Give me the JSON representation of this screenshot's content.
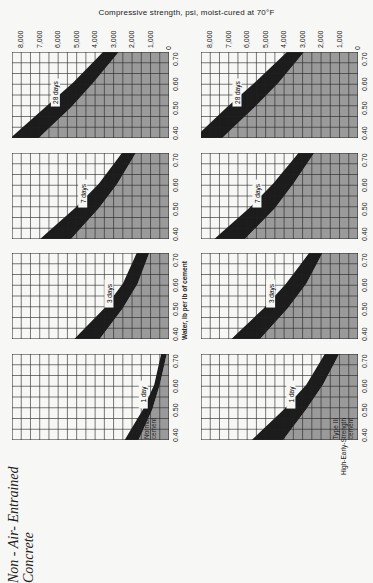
{
  "title": "Compressive strength, psi, moist-cured at 70°F",
  "heading": {
    "line1": "Non - Air- Entrained",
    "line2": "Concrete"
  },
  "x_axis_label": "Water, lb per lb of cement",
  "strength_ticks": [
    "8,000",
    "7,000",
    "6,000",
    "5,000",
    "4,000",
    "3,000",
    "2,000",
    "1,000",
    "0"
  ],
  "wc_ticks": [
    "0.40",
    "0.50",
    "0.60",
    "0.70"
  ],
  "columns": [
    {
      "cement_label": [
        "Type I",
        "Normal",
        "cement"
      ]
    },
    {
      "cement_label": [
        "Type III",
        "High-Early-Strength",
        "cement"
      ]
    }
  ],
  "colors": {
    "band": "#1c1c1c",
    "shade": "#9a9a9a",
    "grid": "#222222",
    "background": "#f7f7f5"
  },
  "chart_data": {
    "type": "area",
    "title": "Compressive strength, psi, moist-cured at 70°F",
    "xlabel": "Water, lb per lb of cement (water-cement ratio)",
    "ylabel": "Compressive strength, psi",
    "xlim": [
      0.375,
      0.725
    ],
    "ylim": [
      0,
      8500
    ],
    "grid": true,
    "x": [
      0.4,
      0.5,
      0.6,
      0.7
    ],
    "panels": [
      {
        "cement": "Type I Normal cement",
        "age": "28 days",
        "lower": [
          6700,
          5300,
          4100,
          3000
        ],
        "upper": [
          8200,
          6700,
          5200,
          3900
        ]
      },
      {
        "cement": "Type I Normal cement",
        "age": "7 days",
        "lower": [
          5000,
          3800,
          2800,
          2000
        ],
        "upper": [
          6600,
          5100,
          3800,
          2800
        ]
      },
      {
        "cement": "Type I Normal cement",
        "age": "3 days",
        "lower": [
          3500,
          2500,
          1700,
          1200
        ],
        "upper": [
          4800,
          3500,
          2500,
          1900
        ]
      },
      {
        "cement": "Type I Normal cement",
        "age": "1 day",
        "lower": [
          1500,
          900,
          500,
          200
        ],
        "upper": [
          2200,
          1400,
          800,
          500
        ]
      },
      {
        "cement": "Type III High-Early-Strength cement",
        "age": "28 days",
        "lower": [
          7000,
          5600,
          4300,
          3200
        ],
        "upper": [
          8500,
          7100,
          5600,
          4200
        ]
      },
      {
        "cement": "Type III High-Early-Strength cement",
        "age": "7 days",
        "lower": [
          5800,
          4500,
          3500,
          2600
        ],
        "upper": [
          7400,
          5900,
          4600,
          3500
        ]
      },
      {
        "cement": "Type III High-Early-Strength cement",
        "age": "3 days",
        "lower": [
          5000,
          3800,
          2800,
          2100
        ],
        "upper": [
          6500,
          5100,
          3900,
          2900
        ]
      },
      {
        "cement": "Type III High-Early-Strength cement",
        "age": "1 day",
        "lower": [
          3800,
          2800,
          1900,
          1200
        ],
        "upper": [
          5400,
          4000,
          2800,
          2000
        ]
      }
    ]
  }
}
